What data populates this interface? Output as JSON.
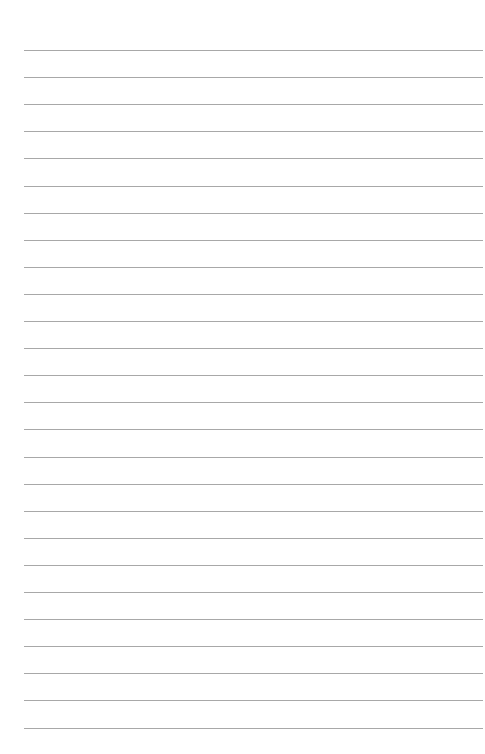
{
  "page": {
    "type": "lined-paper",
    "background_color": "#ffffff",
    "line_color": "#a8a8a8",
    "line_count": 26,
    "first_line_y": 50,
    "line_spacing": 27.1,
    "line_left": 24,
    "line_right_margin": 2
  }
}
